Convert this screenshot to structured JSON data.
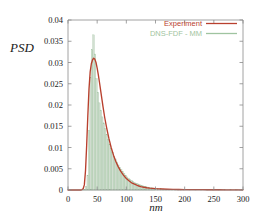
{
  "chart_data": {
    "type": "line",
    "title": "",
    "subtitle": "",
    "xlabel": "nm",
    "ylabel": "PSD",
    "xlim": [
      0,
      300
    ],
    "ylim": [
      0,
      0.04
    ],
    "grid": false,
    "legend_position": "top-right",
    "xticks": [
      "0",
      "50",
      "100",
      "150",
      "200",
      "250",
      "300"
    ],
    "xtick_values": [
      0,
      50,
      100,
      150,
      200,
      250,
      300
    ],
    "yticks": [
      "0",
      "0.005",
      "0.01",
      "0.015",
      "0.02",
      "0.025",
      "0.03",
      "0.035",
      "0.04"
    ],
    "ytick_values": [
      0,
      0.005,
      0.01,
      0.015,
      0.02,
      0.025,
      0.03,
      0.035,
      0.04
    ],
    "series": [
      {
        "name": "Experiment",
        "style": "line",
        "color": "#b8402e",
        "x": [
          0,
          5,
          10,
          15,
          20,
          22,
          24,
          26,
          28,
          30,
          32,
          34,
          36,
          38,
          40,
          42,
          44,
          46,
          48,
          50,
          52,
          54,
          56,
          58,
          60,
          63,
          66,
          70,
          74,
          78,
          82,
          86,
          90,
          95,
          100,
          105,
          110,
          115,
          120,
          125,
          130,
          135,
          140,
          145,
          150,
          160,
          170,
          180,
          190,
          200,
          210,
          220,
          230,
          240,
          250,
          260,
          270,
          280,
          290,
          300
        ],
        "y": [
          0.0,
          0.0,
          0.0,
          0.0,
          0.0,
          0.0,
          0.0001,
          0.0003,
          0.0012,
          0.0045,
          0.0105,
          0.0175,
          0.0238,
          0.0278,
          0.0297,
          0.0306,
          0.031,
          0.0308,
          0.03,
          0.0287,
          0.0271,
          0.0253,
          0.0234,
          0.0215,
          0.0196,
          0.017,
          0.0148,
          0.0122,
          0.01,
          0.0082,
          0.0067,
          0.0055,
          0.0045,
          0.0035,
          0.0027,
          0.0021,
          0.0016,
          0.0013,
          0.001,
          0.0008,
          0.00065,
          0.00053,
          0.00044,
          0.00037,
          0.00031,
          0.00023,
          0.00018,
          0.00014,
          0.00012,
          0.0001,
          9e-05,
          8e-05,
          7e-05,
          6e-05,
          5e-05,
          5e-05,
          4e-05,
          4e-05,
          3e-05,
          3e-05
        ]
      },
      {
        "name": "DNS-FDF - MM",
        "style": "histogram",
        "color": "#9fc4a0",
        "fill": "#d2ded1",
        "bin_width": 2.5,
        "x": [
          26.25,
          28.75,
          31.25,
          33.75,
          36.25,
          38.75,
          41.25,
          43.75,
          46.25,
          48.75,
          51.25,
          53.75,
          56.25,
          58.75,
          61.25,
          63.75,
          66.25,
          68.75,
          71.25,
          73.75,
          76.25,
          78.75,
          81.25,
          83.75,
          86.25,
          88.75,
          91.25,
          93.75,
          96.25,
          98.75,
          101.25,
          103.75,
          106.25,
          108.75,
          111.25,
          113.75,
          116.25,
          118.75,
          121.25,
          123.75,
          126.25,
          128.75,
          131.25,
          133.75,
          136.25,
          138.75,
          141.25,
          143.75,
          146.25,
          148.75,
          153.75,
          158.75,
          163.75,
          168.75,
          173.75,
          178.75,
          183.75,
          188.75,
          193.75,
          198.75,
          208.75,
          218.75,
          228.75,
          238.75,
          248.75,
          258.75,
          268.75,
          278.75,
          288.75,
          298.75
        ],
        "y": [
          5e-05,
          0.0002,
          0.0008,
          0.0035,
          0.014,
          0.0265,
          0.033,
          0.0365,
          0.032,
          0.0262,
          0.023,
          0.0205,
          0.0188,
          0.0172,
          0.0158,
          0.0144,
          0.0131,
          0.0119,
          0.0108,
          0.0098,
          0.0089,
          0.008,
          0.0073,
          0.0066,
          0.0059,
          0.0053,
          0.0048,
          0.0043,
          0.0039,
          0.0035,
          0.0031,
          0.0028,
          0.0025,
          0.0023,
          0.002,
          0.0018,
          0.0016,
          0.0015,
          0.0013,
          0.0012,
          0.0011,
          0.00095,
          0.00085,
          0.00078,
          0.0007,
          0.00063,
          0.00057,
          0.00051,
          0.00046,
          0.00042,
          0.00035,
          0.00029,
          0.00024,
          0.0002,
          0.00017,
          0.00015,
          0.00013,
          0.00011,
          0.0001,
          9e-05,
          8e-05,
          7e-05,
          6e-05,
          5e-05,
          5e-05,
          4e-05,
          4e-05,
          3e-05,
          3e-05,
          3e-05
        ]
      }
    ],
    "legend": [
      {
        "label": "Experiment",
        "color": "#b8402e"
      },
      {
        "label": "DNS-FDF - MM",
        "color": "#9fc4a0"
      }
    ]
  }
}
